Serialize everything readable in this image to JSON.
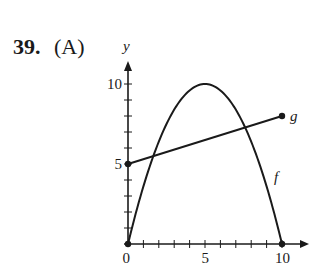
{
  "question": {
    "number": "39.",
    "answer": "(A)"
  },
  "chart_data": {
    "type": "line",
    "title": "",
    "xlabel": "",
    "ylabel": "y",
    "xlim": [
      0,
      10
    ],
    "ylim": [
      0,
      10
    ],
    "x_ticks": [
      0,
      1,
      2,
      3,
      4,
      5,
      6,
      7,
      8,
      9,
      10
    ],
    "x_tick_labels": {
      "0": "0",
      "5": "5",
      "10": "10"
    },
    "y_ticks": [
      0,
      1,
      2,
      3,
      4,
      5,
      6,
      7,
      8,
      9,
      10
    ],
    "y_tick_labels": {
      "5": "5",
      "10": "10"
    },
    "grid": false,
    "series": [
      {
        "name": "f",
        "kind": "parabola",
        "description": "Downward parabola with zeros at x=0 and x=10, maximum 10 at x=5",
        "x": [
          0,
          1,
          2,
          3,
          4,
          5,
          6,
          7,
          8,
          9,
          10
        ],
        "values": [
          0,
          3.6,
          6.4,
          8.4,
          9.6,
          10,
          9.6,
          8.4,
          6.4,
          3.6,
          0
        ],
        "endpoints": [
          [
            0,
            0
          ],
          [
            10,
            0
          ]
        ]
      },
      {
        "name": "g",
        "kind": "line segment",
        "description": "Line segment from (0,5) to (10,8)",
        "x": [
          0,
          10
        ],
        "values": [
          5,
          8
        ],
        "endpoints": [
          [
            0,
            5
          ],
          [
            10,
            8
          ]
        ]
      }
    ],
    "annotations": [
      "f",
      "g"
    ]
  }
}
